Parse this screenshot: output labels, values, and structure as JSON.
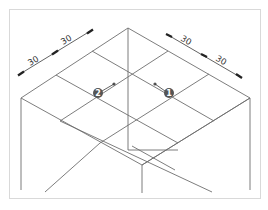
{
  "diagram": {
    "type": "isometric-grid",
    "line_color": "#6e6e6e",
    "frame_color": "#d9d9d9",
    "dimensions": {
      "left": [
        {
          "label": "30"
        },
        {
          "label": "30"
        }
      ],
      "right": [
        {
          "label": "30"
        },
        {
          "label": "30"
        }
      ]
    },
    "callouts": [
      {
        "number": "1",
        "label": "❶"
      },
      {
        "number": "2",
        "label": "❷"
      }
    ]
  }
}
